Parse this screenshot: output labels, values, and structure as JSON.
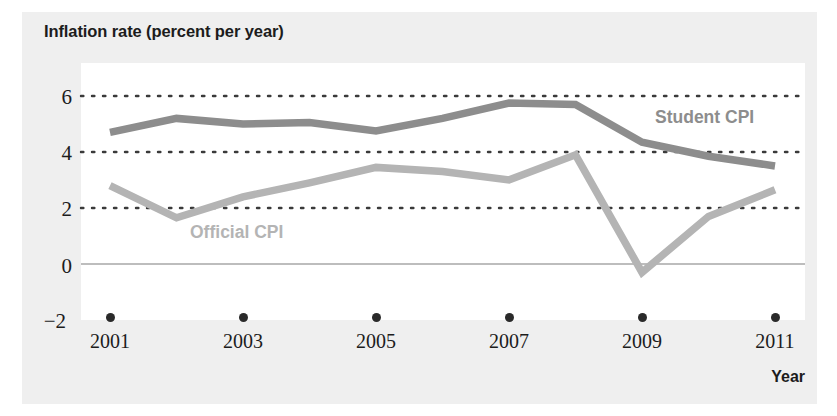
{
  "figure": {
    "background_color": "#efefef",
    "plot_background_color": "#ffffff"
  },
  "chart_data": {
    "type": "line",
    "title": "",
    "ylabel": "Inflation rate (percent per year)",
    "xlabel": "Year",
    "x": [
      2001,
      2002,
      2003,
      2004,
      2005,
      2006,
      2007,
      2008,
      2009,
      2010,
      2011
    ],
    "xtick_labels": [
      "2001",
      "2003",
      "2005",
      "2007",
      "2009",
      "2011"
    ],
    "xticks": [
      2001,
      2003,
      2005,
      2007,
      2009,
      2011
    ],
    "ytick_labels": [
      "6",
      "4",
      "2",
      "0",
      "−2"
    ],
    "yticks": [
      6,
      4,
      2,
      0,
      -2
    ],
    "xlim": [
      2001,
      2011
    ],
    "ylim": [
      -2,
      6.8
    ],
    "grid": "dotted-horizontal",
    "legend": "inline-annotations",
    "series": [
      {
        "name": "Student CPI",
        "color": "#8d8d8d",
        "values": [
          4.7,
          5.2,
          5.0,
          5.05,
          4.75,
          5.2,
          5.75,
          5.7,
          4.35,
          3.85,
          3.5
        ]
      },
      {
        "name": "Official CPI",
        "color": "#b4b4b4",
        "values": [
          2.8,
          1.65,
          2.4,
          2.9,
          3.45,
          3.3,
          3.0,
          3.9,
          -0.3,
          1.7,
          2.65
        ]
      }
    ],
    "annotations": [
      {
        "text": "Student CPI",
        "color": "#8d8d8d"
      },
      {
        "text": "Official CPI",
        "color": "#b4b4b4"
      }
    ]
  },
  "axis": {
    "y_title": "Inflation rate (percent per year)",
    "x_title": "Year",
    "y_labels": [
      "6",
      "4",
      "2",
      "0",
      "−2"
    ],
    "x_labels": [
      "2001",
      "2003",
      "2005",
      "2007",
      "2009",
      "2011"
    ]
  }
}
